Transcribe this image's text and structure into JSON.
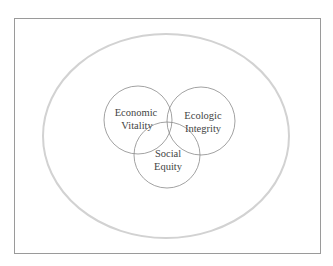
{
  "diagram": {
    "type": "venn",
    "frame": {
      "x": 14,
      "y": 18,
      "width": 306,
      "height": 235,
      "stroke": "#9a9a9a"
    },
    "outer_ellipse": {
      "cx": 166,
      "cy": 136,
      "rx": 123,
      "ry": 102,
      "stroke": "#cfcfcf"
    },
    "circles": [
      {
        "id": "economic",
        "line1": "Economic",
        "line2": "Vitality",
        "cx": 138,
        "cy": 120,
        "r": 34
      },
      {
        "id": "ecologic",
        "line1": "Ecologic",
        "line2": "Integrity",
        "cx": 201,
        "cy": 121,
        "r": 34
      },
      {
        "id": "social",
        "line1": "Social",
        "line2": "Equity",
        "cx": 167,
        "cy": 155,
        "r": 33
      }
    ],
    "circle_stroke": "#8a8a8a"
  }
}
